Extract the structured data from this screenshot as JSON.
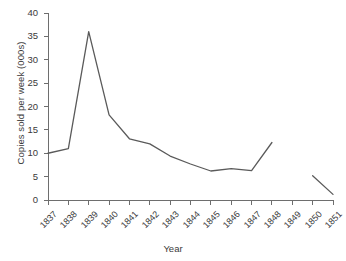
{
  "chart_data": {
    "type": "line",
    "title": "",
    "subtitle": "",
    "xlabel": "Year",
    "ylabel": "Copies sold per week (000s)",
    "categories": [
      "1837",
      "1838",
      "1839",
      "1840",
      "1841",
      "1842",
      "1843",
      "1844",
      "1845",
      "1846",
      "1847",
      "1848",
      "1849",
      "1850",
      "1851"
    ],
    "x": [
      1837,
      1838,
      1839,
      1840,
      1841,
      1842,
      1843,
      1844,
      1845,
      1846,
      1847,
      1848,
      1849,
      1850,
      1851
    ],
    "series": [
      {
        "name": "Copies sold per week",
        "x": [
          1837,
          1838,
          1839,
          1840,
          1841,
          1842,
          1843,
          1844,
          1845,
          1846,
          1847,
          1848
        ],
        "values": [
          10.0,
          11.0,
          36.0,
          18.2,
          13.1,
          12.0,
          9.4,
          7.7,
          6.2,
          6.7,
          6.3,
          12.3
        ]
      },
      {
        "name": "Copies sold per week (later period)",
        "x": [
          1850,
          1851
        ],
        "values": [
          5.2,
          1.2
        ]
      }
    ],
    "xlim": [
      1837,
      1851
    ],
    "ylim": [
      0,
      40
    ],
    "ytick_values": [
      0,
      5,
      10,
      15,
      20,
      25,
      30,
      35,
      40
    ],
    "ytick_labels": [
      "0",
      "5",
      "10",
      "15",
      "20",
      "25",
      "30",
      "35",
      "40"
    ],
    "grid": false,
    "legend": false,
    "legend_position": "none",
    "line_color": "#5a5a5a",
    "axis_color": "#6e6e6e",
    "text_color": "#3a3a3a",
    "background": "#ffffff",
    "xlabel_rotation_deg": -45
  }
}
